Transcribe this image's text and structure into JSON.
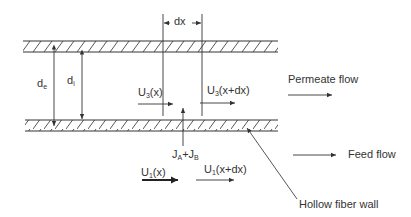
{
  "diagram": {
    "labels": {
      "dx": "dx",
      "d_outer": {
        "base": "d",
        "sub": "e"
      },
      "d_inner": {
        "base": "d",
        "sub": "i"
      },
      "u3_x": {
        "base": "U",
        "sub": "3",
        "arg": "(x)"
      },
      "u3_xdx": {
        "base": "U",
        "sub": "3",
        "arg": "(x+dx)"
      },
      "flux": {
        "a": "J",
        "a_sub": "A",
        "plus": "+",
        "b": "J",
        "b_sub": "B"
      },
      "u1_x": {
        "base": "U",
        "sub": "1",
        "arg": "(x)"
      },
      "u1_xdx": {
        "base": "U",
        "sub": "1",
        "arg": "(x+dx)"
      },
      "permeate_flow": "Permeate flow",
      "feed_flow": "Feed flow",
      "hollow_fiber_wall": "Hollow fiber wall"
    },
    "colors": {
      "line": "#333333",
      "background": "#ffffff"
    }
  }
}
